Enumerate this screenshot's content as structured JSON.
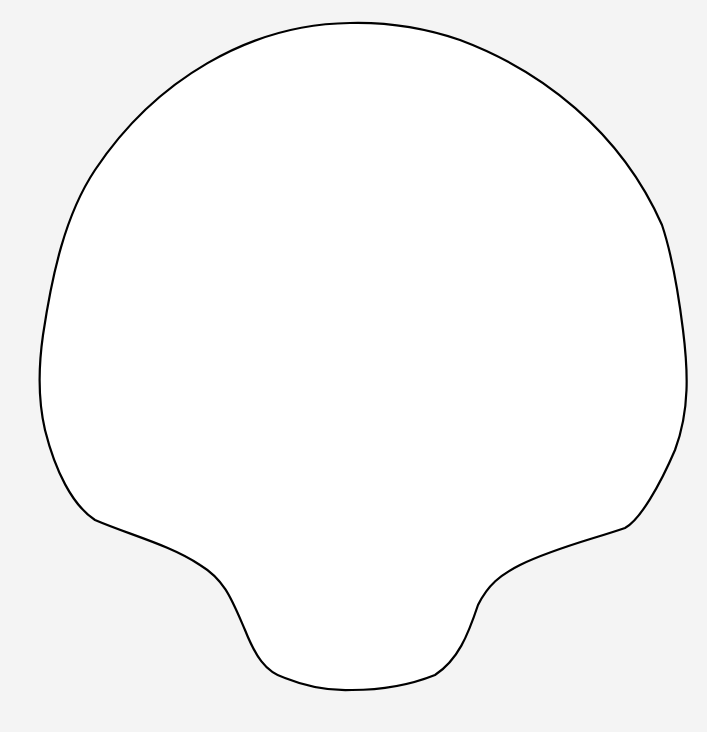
{
  "canvas": {
    "width": 707,
    "height": 732,
    "background": "#f4f4f4"
  },
  "shape": {
    "description": "mushroom / shell-like outline silhouette",
    "fill": "#ffffff",
    "stroke": "#000000",
    "stroke_width": 2.2
  }
}
